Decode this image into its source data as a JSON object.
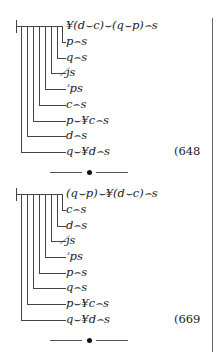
{
  "blocks": [
    {
      "rows": [
        "¥(d⌣c)⌣(q⌣p)⌢s",
        "p⌢s",
        "q⌢s",
        "ȷ̸s",
        "ʾps",
        "c⌢s",
        "p⌣¥c⌢s",
        "d⌢s",
        "q⌣¥d⌢s"
      ],
      "equation_number": "(648"
    },
    {
      "rows": [
        "(q⌣p)⌣¥(d⌣c)⌢s",
        "c⌢s",
        "d⌢s",
        "ȷ̸s",
        "ʾps",
        "p⌢s",
        "q⌢s",
        "p⌣¥c⌢s",
        "q⌣¥d⌢s"
      ],
      "equation_number": "(669"
    }
  ]
}
